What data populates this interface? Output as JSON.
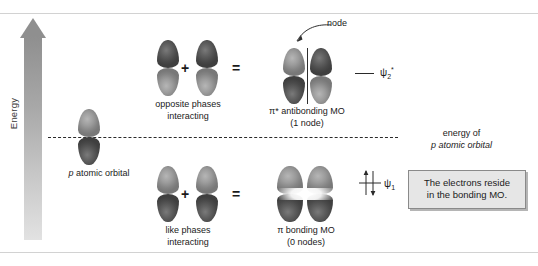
{
  "figure": {
    "axis": {
      "label": "Energy"
    },
    "reference": {
      "line_1": "energy of",
      "line_2": "p atomic orbital"
    },
    "p_orbital": {
      "caption_italic": "p",
      "caption_rest": " atomic orbital"
    },
    "antibonding_row": {
      "operand_caption_1": "opposite phases",
      "operand_caption_2": "interacting",
      "plus": "+",
      "equals": "=",
      "result_caption_1": "π* antibonding MO",
      "result_caption_2": "(1 node)",
      "node_label": "node",
      "psi_symbol": "ψ",
      "psi_sub": "2",
      "psi_sup": "*"
    },
    "bonding_row": {
      "operand_caption_1": "like phases",
      "operand_caption_2": "interacting",
      "plus": "+",
      "equals": "=",
      "result_caption_1": "π bonding MO",
      "result_caption_2": "(0 nodes)",
      "psi_symbol": "ψ",
      "psi_sub": "1"
    },
    "callout": {
      "line_1": "The electrons reside",
      "line_2": "in the bonding MO."
    }
  },
  "colors": {
    "lobe_dark": "#4a4a4a",
    "lobe_light": "#949494",
    "axis_gradient_top": "#8f8f8f",
    "axis_gradient_bottom": "#e2e2e2",
    "callout_background": "#e6e6e6",
    "callout_border": "#8a8a8a",
    "rule": "#d2d2d2",
    "text": "#1a1a1a"
  }
}
